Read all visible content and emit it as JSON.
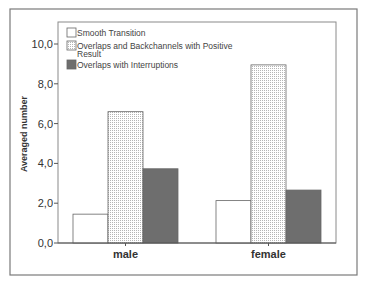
{
  "chart_data": {
    "type": "bar",
    "title": "",
    "xlabel": "",
    "ylabel": "Averaged number",
    "ylim": [
      0,
      10
    ],
    "yticks": [
      "0,0",
      "2,0",
      "4,0",
      "6,0",
      "8,0",
      "10,0"
    ],
    "ytick_values": [
      0,
      2,
      4,
      6,
      8,
      10
    ],
    "grid": false,
    "legend_position": "top-left inside",
    "categories": [
      "male",
      "female"
    ],
    "series": [
      {
        "name": "Smooth Transition",
        "values": [
          1.45,
          2.13
        ],
        "fill": "#ffffff",
        "pattern": "none"
      },
      {
        "name": "Overlaps and Backchannels with Positive Result",
        "values": [
          6.6,
          8.95
        ],
        "fill": "#f2f2f2",
        "pattern": "dotted"
      },
      {
        "name": "Overlaps with Interruptions",
        "values": [
          3.73,
          2.66
        ],
        "fill": "#6e6e6e",
        "pattern": "none"
      }
    ]
  },
  "legend": {
    "items": [
      {
        "line1": "Smooth Transition",
        "line2": ""
      },
      {
        "line1": "Overlaps and Backchannels with Positive",
        "line2": "Result"
      },
      {
        "line1": "Overlaps with Interruptions",
        "line2": ""
      }
    ]
  },
  "colors": {
    "frame": "#7a7a7a",
    "axis": "#555555",
    "text": "#333333",
    "bar_outline": "#666666"
  }
}
